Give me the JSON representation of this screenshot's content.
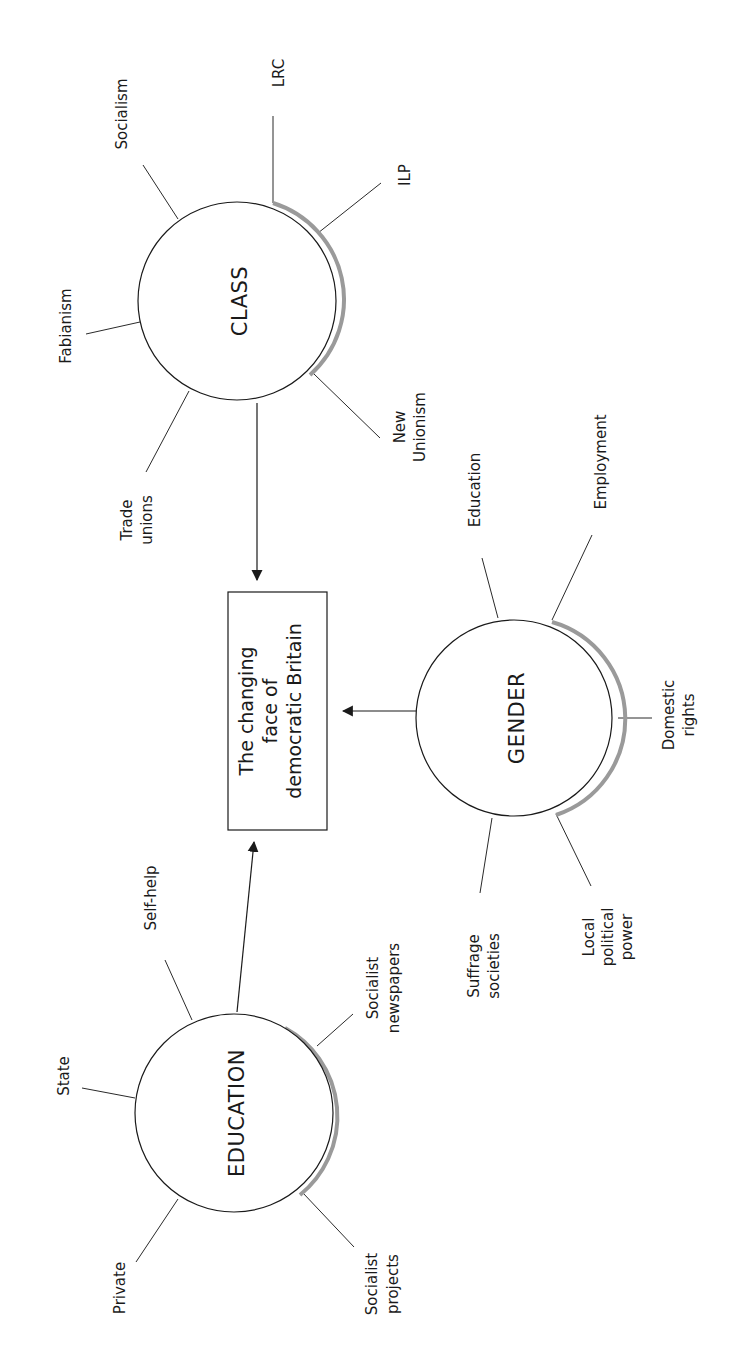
{
  "diagram": {
    "orientation": "rotated 90° counterclockwise",
    "central": {
      "lines": [
        "The changing",
        "face of",
        "democratic Britain"
      ]
    },
    "hubs": {
      "class": {
        "label": "CLASS",
        "leaves": {
          "socialism": "Socialism",
          "lrc": "LRC",
          "ilp": "ILP",
          "fabianism": "Fabianism",
          "trade_unions": [
            "Trade",
            "unions"
          ],
          "new_unionism": [
            "New",
            "Unionism"
          ]
        }
      },
      "gender": {
        "label": "GENDER",
        "leaves": {
          "education": "Education",
          "employment": "Employment",
          "domestic_rights": [
            "Domestic",
            "rights"
          ],
          "suffrage_societies": [
            "Suffrage",
            "societies"
          ],
          "local_political_power": [
            "Local",
            "political",
            "power"
          ]
        }
      },
      "education": {
        "label": "EDUCATION",
        "leaves": {
          "self_help": "Self-help",
          "socialist_newspapers": [
            "Socialist",
            "newspapers"
          ],
          "state": "State",
          "private": "Private",
          "socialist_projects": [
            "Socialist",
            "projects"
          ]
        }
      }
    },
    "edges": [
      {
        "from": "CLASS",
        "to": "The changing face of democratic Britain"
      },
      {
        "from": "GENDER",
        "to": "The changing face of democratic Britain"
      },
      {
        "from": "EDUCATION",
        "to": "The changing face of democratic Britain"
      }
    ],
    "colors": {
      "line": "#1a1a1a",
      "shadow": "#9a9a9a",
      "background": "#ffffff"
    }
  }
}
